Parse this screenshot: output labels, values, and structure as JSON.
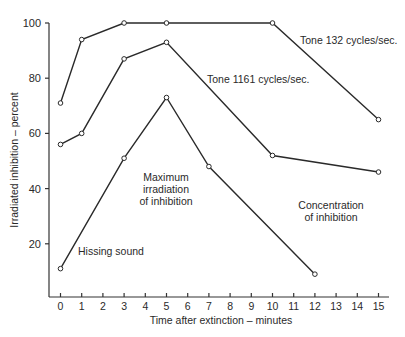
{
  "chart_data": {
    "type": "line",
    "title": "",
    "xlabel": "Time after extinction – minutes",
    "ylabel": "Irradiated inhibition – percent",
    "xlim": [
      0,
      15
    ],
    "ylim": [
      0,
      100
    ],
    "x_ticks": [
      "0",
      "1",
      "2",
      "3",
      "4",
      "5",
      "6",
      "7",
      "8",
      "9",
      "10",
      "11",
      "12",
      "13",
      "14",
      "15"
    ],
    "y_ticks": [
      "20",
      "40",
      "60",
      "80",
      "100"
    ],
    "grid": false,
    "legend": "inline labels",
    "series": [
      {
        "name": "Tone 132 cycles/sec.",
        "x": [
          0,
          1,
          3,
          5,
          10,
          15
        ],
        "values": [
          71,
          94,
          100,
          100,
          100,
          65
        ]
      },
      {
        "name": "Tone 1161 cycles/sec.",
        "x": [
          0,
          1,
          3,
          5,
          10,
          15
        ],
        "values": [
          56,
          60,
          87,
          93,
          52,
          46
        ]
      },
      {
        "name": "Hissing sound",
        "x": [
          0,
          3,
          5,
          7,
          12
        ],
        "values": [
          11,
          51,
          73,
          48,
          9
        ]
      }
    ],
    "annotations": [
      {
        "text": [
          "Maximum",
          "irradiation",
          "of inhibition"
        ],
        "x": 5,
        "y": 39
      },
      {
        "text": [
          "Concentration",
          "of inhibition"
        ],
        "x": 12.5,
        "y": 42
      }
    ]
  },
  "labels": {
    "series0": "Tone 132 cycles/sec.",
    "series1": "Tone 1161 cycles/sec.",
    "series2": "Hissing sound",
    "max_irr_1": "Maximum",
    "max_irr_2": "irradiation",
    "max_irr_3": "of inhibition",
    "conc_1": "Concentration",
    "conc_2": "of inhibition",
    "xlabel": "Time after extinction – minutes",
    "ylabel": "Irradiated inhibition – percent"
  }
}
